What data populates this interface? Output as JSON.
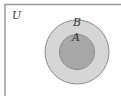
{
  "diagram": {
    "type": "venn",
    "universe_label": "U",
    "sets": [
      {
        "name": "B",
        "label": "B",
        "fill": "#d6d6d6",
        "contains": [
          "A"
        ]
      },
      {
        "name": "A",
        "label": "A",
        "fill": "#a8a8a8"
      }
    ],
    "colors": {
      "border": "#8a8a8a",
      "universe_border": "#9a9a9a",
      "background": "#ffffff"
    }
  }
}
